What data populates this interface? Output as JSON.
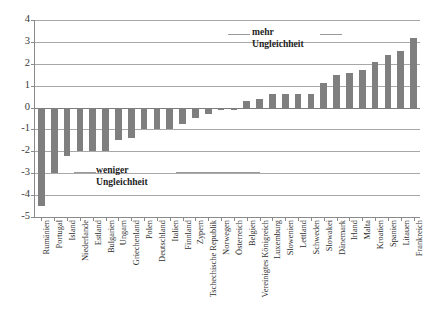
{
  "chart_data": {
    "type": "bar",
    "title": "",
    "subtitle": "",
    "xlabel": "",
    "ylabel": "",
    "ylim": [
      -5,
      4
    ],
    "yticks": [
      4,
      3,
      2,
      1,
      0,
      -1,
      -2,
      -3,
      -4,
      -5
    ],
    "ytick_labels": [
      "4",
      "3",
      "2",
      "1",
      "0",
      "-1",
      "-2",
      "-3",
      "-4",
      "-5"
    ],
    "grid": true,
    "grid_axis": "y",
    "legend": false,
    "bar_color": "#7f7f7f",
    "categories": [
      "Rumänien",
      "Portugal",
      "Island",
      "Niederlande",
      "Estland",
      "Bulgarien",
      "Ungarn",
      "Griechenland",
      "Polen",
      "Deutschland",
      "Italien",
      "Finnland",
      "Zypern",
      "Tschechische Republik",
      "Norwegen",
      "Österreich",
      "Belgien",
      "Vereinigtes Königreich",
      "Luxemburg",
      "Slowenien",
      "Lettland",
      "Schweden",
      "Slowakei",
      "Dänemark",
      "Irland",
      "Malta",
      "Kroatien",
      "Spanien",
      "Litauen",
      "Frankreich"
    ],
    "values": [
      -4.5,
      -3.0,
      -2.2,
      -2.0,
      -2.0,
      -2.0,
      -1.5,
      -1.4,
      -1.0,
      -1.0,
      -1.0,
      -0.75,
      -0.5,
      -0.3,
      -0.1,
      -0.1,
      0.3,
      0.4,
      0.6,
      0.6,
      0.6,
      0.6,
      1.1,
      1.5,
      1.6,
      1.7,
      2.1,
      2.4,
      2.6,
      3.2
    ]
  },
  "annotations": {
    "more": {
      "line1": "mehr",
      "line2": "Ungleichheit"
    },
    "less": {
      "line1": "weniger",
      "line2": "Ungleichheit"
    }
  }
}
